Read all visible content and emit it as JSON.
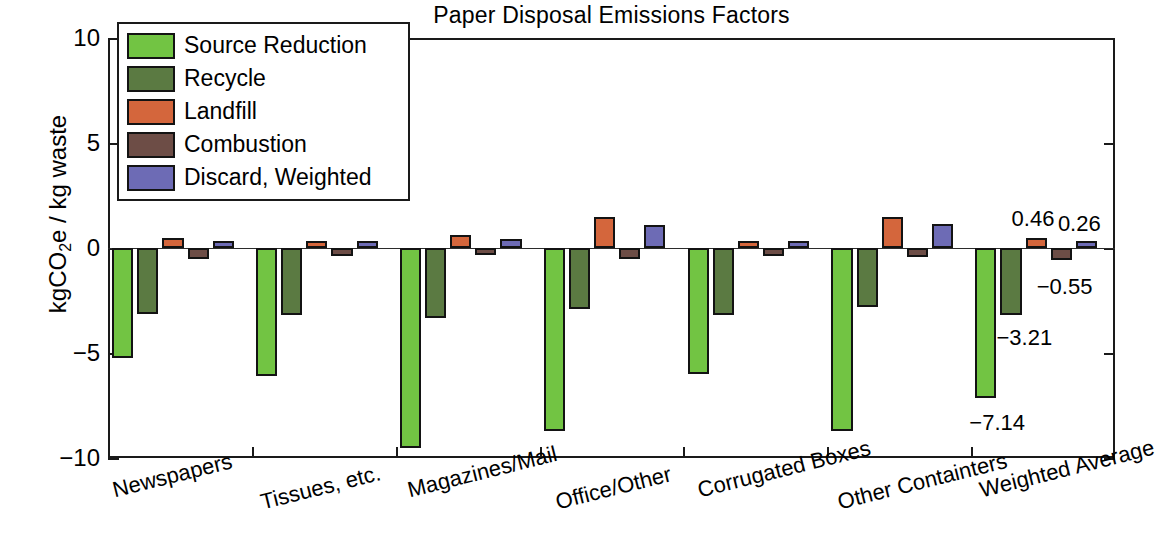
{
  "chart_data": {
    "type": "bar",
    "title": "Paper Disposal Emissions Factors",
    "xlabel": "",
    "ylabel": "kgCO2e / kg waste",
    "ylabel_parts": {
      "pre": "kgCO",
      "sub": "2",
      "post": "e / kg waste"
    },
    "ylim": [
      -10,
      10
    ],
    "yticks": [
      10,
      5,
      0,
      -5,
      -10
    ],
    "ytick_labels": [
      "10",
      "5",
      "0",
      "−5",
      "−10"
    ],
    "grid": false,
    "legend_position": "upper left",
    "categories": [
      "Newspapers",
      "Tissues, etc.",
      "Magazines/Mail",
      "Office/Other",
      "Corrugated Boxes",
      "Other Containters",
      "Weighted Average"
    ],
    "series": [
      {
        "name": "Source Reduction",
        "color": "#72c443",
        "values": [
          -5.25,
          -6.1,
          -9.5,
          -8.7,
          -6.0,
          -8.7,
          -7.14
        ]
      },
      {
        "name": "Recycle",
        "color": "#5b7a42",
        "values": [
          -3.15,
          -3.2,
          -3.35,
          -2.9,
          -3.2,
          -2.8,
          -3.21
        ]
      },
      {
        "name": "Landfill",
        "color": "#d4663c",
        "values": [
          0.48,
          0.04,
          0.62,
          1.48,
          0.05,
          1.5,
          0.46
        ]
      },
      {
        "name": "Combustion",
        "color": "#6d4d46",
        "values": [
          -0.5,
          -0.38,
          -0.3,
          -0.5,
          -0.4,
          -0.45,
          -0.55
        ]
      },
      {
        "name": "Discard, Weighted",
        "color": "#6d6bb5",
        "values": [
          0.34,
          0.02,
          0.42,
          1.1,
          0.03,
          1.15,
          0.26
        ]
      }
    ],
    "annotations": [
      {
        "text": "−7.14",
        "series": "Source Reduction",
        "category": "Weighted Average",
        "value": -7.14
      },
      {
        "text": "−3.21",
        "series": "Recycle",
        "category": "Weighted Average",
        "value": -3.21
      },
      {
        "text": "0.46",
        "series": "Landfill",
        "category": "Weighted Average",
        "value": 0.46
      },
      {
        "text": "−0.55",
        "series": "Combustion",
        "category": "Weighted Average",
        "value": -0.55
      },
      {
        "text": "0.26",
        "series": "Discard, Weighted",
        "category": "Weighted Average",
        "value": 0.26
      }
    ]
  },
  "colors": {
    "axis": "#1a1a1a",
    "bar_edge": "#131313",
    "background": "#ffffff"
  }
}
